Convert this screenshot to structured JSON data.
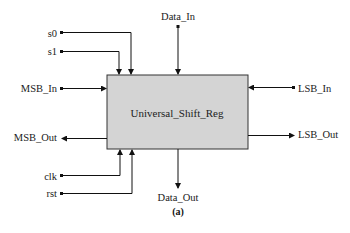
{
  "diagram": {
    "block": {
      "label": "Universal_Shift_Reg",
      "fill": "#d4d4d4",
      "stroke": "#333333"
    },
    "inputs": {
      "s0": "s0",
      "s1": "s1",
      "msb_in": "MSB_In",
      "data_in": "Data_In",
      "lsb_in": "LSB_In",
      "clk": "clk",
      "rst": "rst"
    },
    "outputs": {
      "msb_out": "MSB_Out",
      "lsb_out": "LSB_Out",
      "data_out": "Data_Out"
    },
    "caption": "(a)"
  }
}
